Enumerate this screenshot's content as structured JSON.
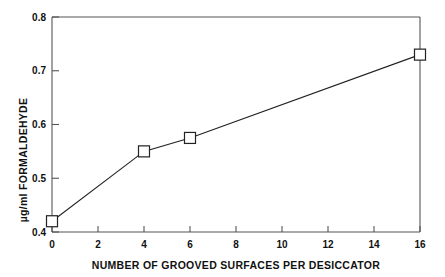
{
  "chart_data": {
    "type": "line",
    "title": "",
    "subtitle": "",
    "xlabel": "NUMBER OF GROOVED SURFACES PER DESICCATOR",
    "ylabel": "µg/ml FORMALDEHYDE",
    "xlim": [
      0,
      16
    ],
    "ylim": [
      0.4,
      0.8
    ],
    "xticks": [
      0,
      2,
      4,
      6,
      8,
      10,
      12,
      14,
      16
    ],
    "xtick_labels": [
      "0",
      "2",
      "4",
      "6",
      "8",
      "10",
      "12",
      "14",
      "16"
    ],
    "yticks": [
      0.4,
      0.5,
      0.6,
      0.7,
      0.8
    ],
    "ytick_labels": [
      "0.4",
      "0.5",
      "0.6",
      "0.7",
      "0.8"
    ],
    "grid": false,
    "legend": null,
    "marker": "open-square",
    "line_color": "#222222",
    "marker_color": "#222222",
    "x": [
      0,
      4,
      6,
      16
    ],
    "values": [
      0.42,
      0.55,
      0.575,
      0.73
    ],
    "series": [
      {
        "name": "formaldehyde",
        "points": [
          {
            "x": 0,
            "y": 0.42
          },
          {
            "x": 4,
            "y": 0.55
          },
          {
            "x": 6,
            "y": 0.575
          },
          {
            "x": 16,
            "y": 0.73
          }
        ]
      }
    ]
  },
  "axes": {
    "y_tick_0": "0.8",
    "y_tick_1": "0.7",
    "y_tick_2": "0.6",
    "y_tick_3": "0.5",
    "y_tick_4": "0.4",
    "x_tick_0": "0",
    "x_tick_1": "2",
    "x_tick_2": "4",
    "x_tick_3": "6",
    "x_tick_4": "8",
    "x_tick_5": "10",
    "x_tick_6": "12",
    "x_tick_7": "14",
    "x_tick_8": "16",
    "x_title": "NUMBER OF GROOVED SURFACES PER DESICCATOR",
    "y_title": "µg/ml FORMALDEHYDE"
  }
}
